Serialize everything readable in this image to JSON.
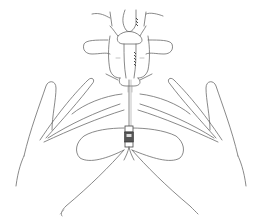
{
  "illustration": {
    "subject": "lumbar spine with two hands guiding a spinal needle",
    "style": "monochrome line drawing",
    "background_color": "#ffffff",
    "line_color": "#6b6b6b",
    "parts": [
      "lumbar-vertebrae",
      "spinous-processes",
      "transverse-processes",
      "left-hand",
      "right-hand",
      "spinal-needle",
      "needle-hub"
    ]
  }
}
